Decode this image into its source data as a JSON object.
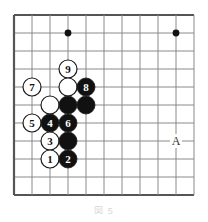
{
  "figure": {
    "kind": "go-board-diagram",
    "caption": "図 5",
    "coordinate_label": "A",
    "board": {
      "grid_spacing_px": 18,
      "origin_x_px": 14,
      "origin_y_px": 15,
      "columns": 11,
      "rows": 11,
      "line_color": "#8a8a8a",
      "border_color": "#555555",
      "background_color": "#ffffff",
      "star_points": [
        {
          "col": 3,
          "row": 1
        },
        {
          "col": 9,
          "row": 1
        }
      ]
    },
    "stones": [
      {
        "col": 3,
        "row": 3,
        "color": "white",
        "label": "9"
      },
      {
        "col": 1,
        "row": 4,
        "color": "white",
        "label": "7"
      },
      {
        "col": 3,
        "row": 4,
        "color": "white",
        "label": ""
      },
      {
        "col": 4,
        "row": 4,
        "color": "black",
        "label": "8"
      },
      {
        "col": 2,
        "row": 5,
        "color": "white",
        "label": ""
      },
      {
        "col": 3,
        "row": 5,
        "color": "black",
        "label": ""
      },
      {
        "col": 4,
        "row": 5,
        "color": "black",
        "label": ""
      },
      {
        "col": 1,
        "row": 6,
        "color": "white",
        "label": "5"
      },
      {
        "col": 2,
        "row": 6,
        "color": "black",
        "label": "4"
      },
      {
        "col": 3,
        "row": 6,
        "color": "black",
        "label": "6"
      },
      {
        "col": 2,
        "row": 7,
        "color": "white",
        "label": "3"
      },
      {
        "col": 3,
        "row": 7,
        "color": "black",
        "label": ""
      },
      {
        "col": 2,
        "row": 8,
        "color": "white",
        "label": "1"
      },
      {
        "col": 3,
        "row": 8,
        "color": "black",
        "label": "2"
      }
    ],
    "markers": [
      {
        "col": 9,
        "row": 7,
        "text": "A"
      }
    ],
    "colors": {
      "black_stone": "#111111",
      "white_stone": "#ffffff",
      "stone_outline": "#1a1a1a",
      "black_label": "#ffffff",
      "white_label": "#111111",
      "marker_text": "#333333"
    },
    "stone_radius_px": 9
  }
}
